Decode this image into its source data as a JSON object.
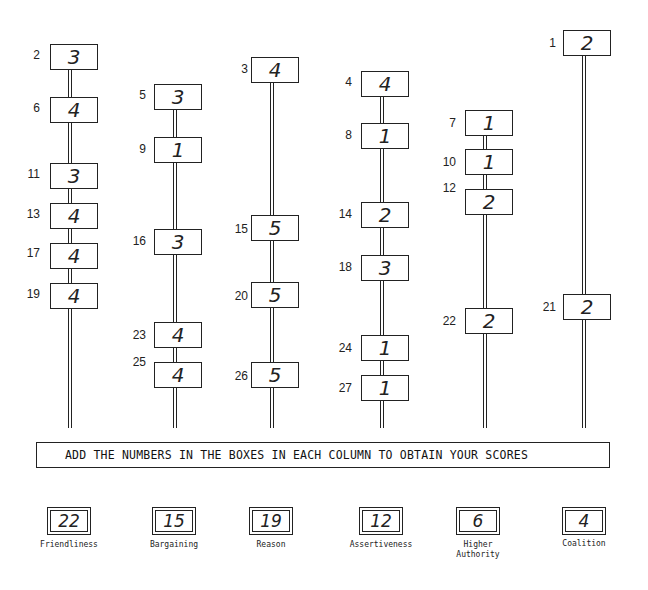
{
  "columns": [
    {
      "name": "Friendliness",
      "items": [
        {
          "q": "2",
          "v": "3"
        },
        {
          "q": "6",
          "v": "4"
        },
        {
          "q": "11",
          "v": "3"
        },
        {
          "q": "13",
          "v": "4"
        },
        {
          "q": "17",
          "v": "4"
        },
        {
          "q": "19",
          "v": "4"
        }
      ]
    },
    {
      "name": "Bargaining",
      "items": [
        {
          "q": "5",
          "v": "3"
        },
        {
          "q": "9",
          "v": "1"
        },
        {
          "q": "16",
          "v": "3"
        },
        {
          "q": "23",
          "v": "4"
        },
        {
          "q": "25",
          "v": "4"
        }
      ]
    },
    {
      "name": "Reason",
      "items": [
        {
          "q": "3",
          "v": "4"
        },
        {
          "q": "15",
          "v": "5"
        },
        {
          "q": "20",
          "v": "5"
        },
        {
          "q": "26",
          "v": "5"
        }
      ]
    },
    {
      "name": "Assertiveness",
      "items": [
        {
          "q": "4",
          "v": "4"
        },
        {
          "q": "8",
          "v": "1"
        },
        {
          "q": "14",
          "v": "2"
        },
        {
          "q": "18",
          "v": "3"
        },
        {
          "q": "24",
          "v": "1"
        },
        {
          "q": "27",
          "v": "1"
        }
      ]
    },
    {
      "name": "Higher Authority",
      "items": [
        {
          "q": "7",
          "v": "1"
        },
        {
          "q": "10",
          "v": "1"
        },
        {
          "q": "12",
          "v": "2"
        },
        {
          "q": "22",
          "v": "2"
        }
      ]
    },
    {
      "name": "Coalition",
      "items": [
        {
          "q": "1",
          "v": "2"
        },
        {
          "q": "21",
          "v": "2"
        }
      ]
    }
  ],
  "instruction": "ADD THE NUMBERS IN THE BOXES IN EACH COLUMN TO OBTAIN YOUR SCORES",
  "scores": [
    {
      "label": "Friendliness",
      "value": "22"
    },
    {
      "label": "Bargaining",
      "value": "15"
    },
    {
      "label": "Reason",
      "value": "19"
    },
    {
      "label": "Assertiveness",
      "value": "12"
    },
    {
      "label_line1": "Higher",
      "label_line2": "Authority",
      "value": "6"
    },
    {
      "label": "Coalition",
      "value": "4"
    }
  ]
}
